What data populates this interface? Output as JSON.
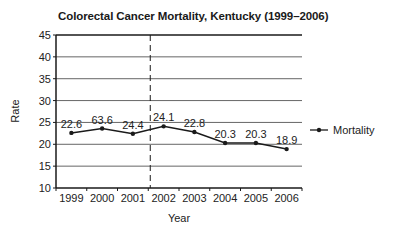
{
  "chart_data": {
    "type": "line",
    "title": "Colorectal Cancer Mortality, Kentucky (1999–2006)",
    "xlabel": "Year",
    "ylabel": "Rate",
    "categories": [
      "1999",
      "2000",
      "2001",
      "2002",
      "2003",
      "2004",
      "2005",
      "2006"
    ],
    "series": [
      {
        "name": "Mortality",
        "values": [
          22.6,
          23.6,
          22.4,
          24.1,
          22.8,
          20.3,
          20.3,
          18.9
        ],
        "data_labels": [
          "22.6",
          "63.6",
          "24.4",
          "24.1",
          "22.8",
          "20.3",
          "20.3",
          "18.9"
        ]
      }
    ],
    "ylim": [
      10,
      45
    ],
    "yticks": [
      10,
      15,
      20,
      25,
      30,
      35,
      40,
      45
    ],
    "grid": true,
    "legend_position": "right",
    "annotations": [
      {
        "type": "vertical-dashed-line",
        "between": [
          "2001",
          "2002"
        ]
      }
    ]
  },
  "colors": {
    "line": "#1a1a1a",
    "grid": "#555555",
    "axis": "#1a1a1a"
  }
}
